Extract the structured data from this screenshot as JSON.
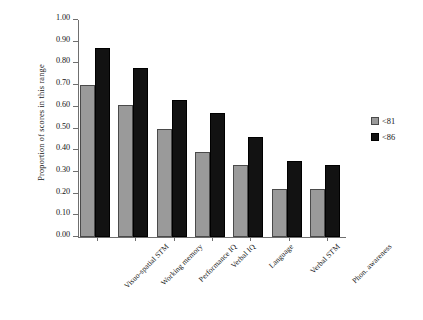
{
  "chart_data": {
    "type": "bar",
    "title": "",
    "xlabel": "",
    "ylabel": "Proportion of scores in this range",
    "ylim": [
      0,
      1.0
    ],
    "ytick_step": 0.1,
    "grid": false,
    "legend_position": "right",
    "categories": [
      "Visuo-spatial STM",
      "Working memory",
      "Performance IQ",
      "Verbal IQ",
      "Language",
      "Verbal STM",
      "Phon. awareness"
    ],
    "series": [
      {
        "name": "<81",
        "color": "#9a9a9a",
        "values": [
          0.7,
          0.61,
          0.5,
          0.39,
          0.33,
          0.22,
          0.22
        ]
      },
      {
        "name": "<86",
        "color": "#121212",
        "values": [
          0.87,
          0.78,
          0.63,
          0.57,
          0.46,
          0.35,
          0.33
        ]
      }
    ],
    "ytick_labels": [
      "0.00",
      "0.10",
      "0.20",
      "0.30",
      "0.40",
      "0.50",
      "0.60",
      "0.70",
      "0.80",
      "0.90",
      "1.00"
    ]
  },
  "legend": {
    "entries": [
      {
        "label": "<81"
      },
      {
        "label": "<86"
      }
    ]
  }
}
